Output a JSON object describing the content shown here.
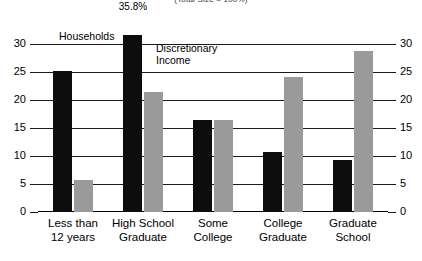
{
  "super_title": "(Total Size = 100%)",
  "annotations": {
    "households_label": "Households",
    "discretionary_label": "Discretionary\nIncome",
    "truncated_value_label": "35.8%"
  },
  "colors": {
    "households": "#0d0d0d",
    "discretionary": "#9a9a9a",
    "axis": "#1a1a1a",
    "background": "#ffffff"
  },
  "chart_data": {
    "type": "bar",
    "title": "(Total Size = 100%)",
    "xlabel": "",
    "ylabel": "",
    "ylim": [
      0,
      30
    ],
    "yticks": [
      0,
      5,
      10,
      15,
      20,
      25,
      30
    ],
    "ytick_labels": [
      "0",
      "5",
      "10",
      "15",
      "20",
      "25",
      "30"
    ],
    "grid": true,
    "dual_axis": true,
    "legend_position": "inline-annotation",
    "axis_break": {
      "series": "Households",
      "category": "High School Graduate",
      "true_value": 35.8,
      "displayed_value_label": "35.8%",
      "note": "bar truncated with zigzag break mark"
    },
    "categories": [
      "Less than\n12 years",
      "High School\nGraduate",
      "Some\nCollege",
      "College\nGraduate",
      "Graduate\nSchool"
    ],
    "series": [
      {
        "name": "Households",
        "color": "#0d0d0d",
        "values": [
          25.2,
          35.8,
          16.5,
          10.8,
          9.3
        ]
      },
      {
        "name": "Discretionary Income",
        "color": "#9a9a9a",
        "values": [
          5.8,
          21.5,
          16.5,
          24.1,
          28.7
        ]
      }
    ]
  }
}
